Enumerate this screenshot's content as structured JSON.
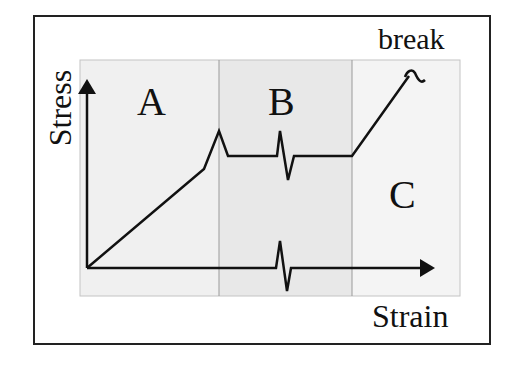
{
  "diagram": {
    "type": "stress-strain schematic",
    "y_axis_label": "Stress",
    "x_axis_label": "Strain",
    "annotation_break": "break",
    "zones": [
      {
        "id": "A",
        "label": "A",
        "fill": "#f0f0f0"
      },
      {
        "id": "B",
        "label": "B",
        "fill": "#e8e8e8"
      },
      {
        "id": "C",
        "label": "C",
        "fill": "#f4f4f4"
      }
    ],
    "colors": {
      "line": "#111111",
      "frame": "#222222",
      "zone_divider": "#9a9a9a"
    }
  }
}
